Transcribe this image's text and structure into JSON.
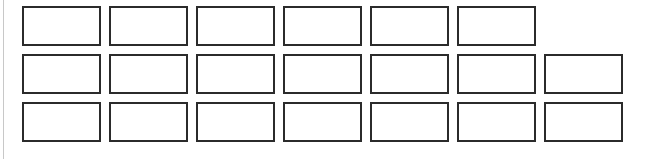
{
  "canvas": {
    "width": 664,
    "height": 159,
    "background_color": "#ffffff"
  },
  "left_rule": {
    "color": "#c8c8c8",
    "visible": true
  },
  "grid": {
    "cell_border_color": "#2b2b2b",
    "cell_fill_color": "#ffffff",
    "cell_label": "",
    "total_cells": 20,
    "rows": [
      {
        "row_label": "",
        "cell_count": 6,
        "cells": [
          {
            "label": ""
          },
          {
            "label": ""
          },
          {
            "label": ""
          },
          {
            "label": ""
          },
          {
            "label": ""
          },
          {
            "label": ""
          }
        ]
      },
      {
        "row_label": "",
        "cell_count": 7,
        "cells": [
          {
            "label": ""
          },
          {
            "label": ""
          },
          {
            "label": ""
          },
          {
            "label": ""
          },
          {
            "label": ""
          },
          {
            "label": ""
          },
          {
            "label": ""
          }
        ]
      },
      {
        "row_label": "",
        "cell_count": 7,
        "cells": [
          {
            "label": ""
          },
          {
            "label": ""
          },
          {
            "label": ""
          },
          {
            "label": ""
          },
          {
            "label": ""
          },
          {
            "label": ""
          },
          {
            "label": ""
          }
        ]
      }
    ]
  }
}
